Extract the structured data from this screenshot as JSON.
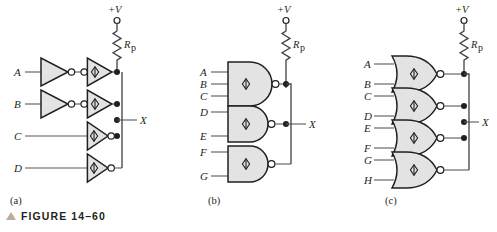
{
  "figure": {
    "caption": "FIGURE 14–60",
    "caption_marker": "triangle-marker",
    "panels": [
      {
        "id": "a",
        "label": "(a)"
      },
      {
        "id": "b",
        "label": "(b)"
      },
      {
        "id": "c",
        "label": "(c)"
      }
    ]
  },
  "common": {
    "supply_label": "+V",
    "pullup_label": "R",
    "pullup_subscript": "p",
    "output_label": "X"
  },
  "panel_a": {
    "title": "(a)",
    "description": "Four wired-AND open-collector inverter stages with pull-up resistor",
    "inputs": [
      "A",
      "B",
      "C",
      "D"
    ],
    "output": "X",
    "supply": "+V",
    "pullup": "R",
    "pullup_sub": "p",
    "stage_rows": [
      {
        "input": "A",
        "has_buffer_inverter": true,
        "oc_bubble_side": "input"
      },
      {
        "input": "B",
        "has_buffer_inverter": true,
        "oc_bubble_side": "input"
      },
      {
        "input": "C",
        "has_buffer_inverter": false,
        "oc_bubble_side": "output"
      },
      {
        "input": "D",
        "has_buffer_inverter": false,
        "oc_bubble_side": "output"
      }
    ]
  },
  "panel_b": {
    "title": "(b)",
    "description": "Three open-collector NAND gates wired-AND to a common output",
    "inputs": [
      "A",
      "B",
      "C",
      "D",
      "E",
      "F",
      "G"
    ],
    "output": "X",
    "supply": "+V",
    "pullup": "R",
    "pullup_sub": "p",
    "gates": [
      {
        "type": "NAND",
        "inputs": [
          "A",
          "B",
          "C"
        ]
      },
      {
        "type": "NAND",
        "inputs": [
          "D",
          "E"
        ]
      },
      {
        "type": "NAND",
        "inputs": [
          "F",
          "G"
        ]
      }
    ]
  },
  "panel_c": {
    "title": "(c)",
    "description": "Four open-collector NOR gates wired-AND to a common output",
    "inputs": [
      "A",
      "B",
      "C",
      "D",
      "E",
      "F",
      "G",
      "H"
    ],
    "output": "X",
    "supply": "+V",
    "pullup": "R",
    "pullup_sub": "p",
    "gates": [
      {
        "type": "NOR",
        "inputs": [
          "A",
          "B"
        ]
      },
      {
        "type": "NOR",
        "inputs": [
          "C",
          "D"
        ]
      },
      {
        "type": "NOR",
        "inputs": [
          "E",
          "F"
        ]
      },
      {
        "type": "NOR",
        "inputs": [
          "G",
          "H"
        ]
      }
    ]
  },
  "colors": {
    "ink": "#231f20",
    "wire": "#58595b",
    "gate_fill": "#e3e3e3",
    "marker": "#b9ad9a",
    "page": "#ffffff"
  }
}
